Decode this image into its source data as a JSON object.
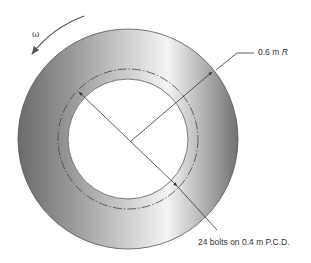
{
  "diagram": {
    "type": "annular disc with bolt circle",
    "rotation_symbol": "ω",
    "outer_radius_label": {
      "value": "0.6 m",
      "symbol": "R"
    },
    "bolt_circle_label": "24 bolts on 0.4 m P.C.D.",
    "colors": {
      "disc_dark": "#6e6e6e",
      "disc_light": "#f2f2f2",
      "lines": "#333333",
      "background": "#ffffff"
    }
  }
}
